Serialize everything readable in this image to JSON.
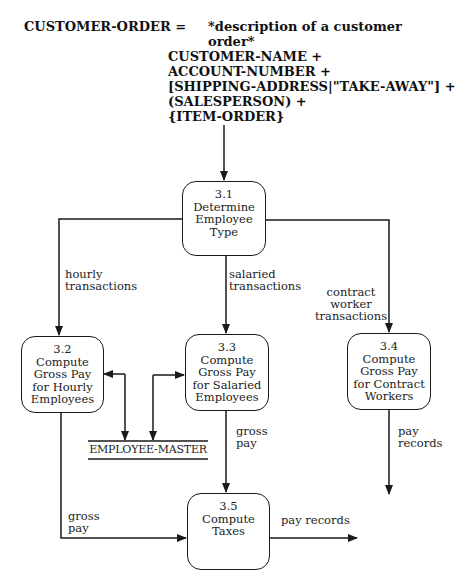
{
  "data_dictionary": {
    "name": "CUSTOMER-ORDER =",
    "description_lines": [
      "*description of a customer",
      "order*"
    ],
    "components": [
      "CUSTOMER-NAME +",
      "ACCOUNT-NUMBER +",
      "[SHIPPING-ADDRESS|\"TAKE-AWAY\"] +",
      "(SALESPERSON) +",
      "{ITEM-ORDER}"
    ]
  },
  "processes": [
    {
      "id": "3.1",
      "lines": [
        "Determine",
        "Employee",
        "Type"
      ]
    },
    {
      "id": "3.2",
      "lines": [
        "Compute",
        "Gross Pay",
        "for Hourly",
        "Employees"
      ]
    },
    {
      "id": "3.3",
      "lines": [
        "Compute",
        "Gross Pay",
        "for Salaried",
        "Employees"
      ]
    },
    {
      "id": "3.4",
      "lines": [
        "Compute",
        "Gross Pay",
        "for Contract",
        "Workers"
      ]
    },
    {
      "id": "3.5",
      "lines": [
        "Compute",
        "Taxes"
      ]
    }
  ],
  "data_store": {
    "label": "EMPLOYEE-MASTER"
  },
  "flows": {
    "hourly": [
      "hourly",
      "transactions"
    ],
    "salaried": [
      "salaried",
      "transactions"
    ],
    "contract": [
      "contract",
      "worker",
      "transactions"
    ],
    "gross_pay_salaried": [
      "gross",
      "pay"
    ],
    "pay_records_contract": [
      "pay",
      "records"
    ],
    "gross_pay_hourly": [
      "gross",
      "pay"
    ],
    "pay_records_out": "pay records"
  },
  "colors": {
    "line": "#1a1a1a",
    "background": "#ffffff"
  }
}
